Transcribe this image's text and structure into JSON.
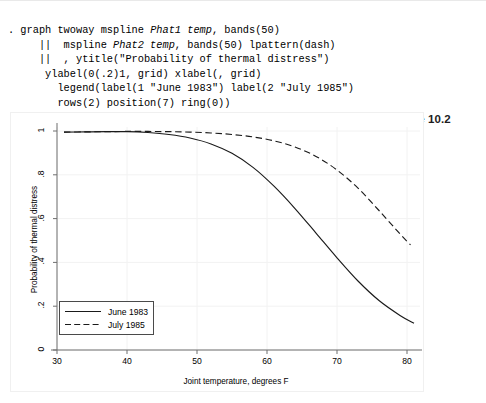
{
  "console": {
    "lines": [
      ". graph twoway mspline <i>Phat1 temp</i>, bands(50)",
      "     || &nbsp;mspline <i>Phat2 temp</i>, bands(50) lpattern(dash)",
      "     || &nbsp;, ytitle(\"Probability of thermal distress\")",
      "      ylabel(0(.2)1, grid) xlabel(, grid)",
      "        legend(label(1 \"June 1983\") label(2 \"July 1985\")",
      "        rows(2) position(7) ring(0))"
    ]
  },
  "figure": {
    "label": "Figure 10.2"
  },
  "chart_data": {
    "type": "line",
    "title": "",
    "xlabel": "Joint temperature, degrees F",
    "ylabel": "Probability of thermal distress",
    "xlim": [
      30,
      81
    ],
    "ylim": [
      0,
      1
    ],
    "xticks": [
      30,
      40,
      50,
      60,
      70,
      80
    ],
    "xtick_labels": [
      "30",
      "40",
      "50",
      "60",
      "70",
      "80"
    ],
    "yticks": [
      0,
      0.2,
      0.4,
      0.6,
      0.8,
      1
    ],
    "ytick_labels": [
      "0",
      ".2",
      ".4",
      ".6",
      ".8",
      "1"
    ],
    "grid": true,
    "legend_position": "inner lower left",
    "series": [
      {
        "name": "June 1983",
        "style": "solid",
        "color": "#1a1a1a",
        "x": [
          31,
          34,
          37,
          40,
          43,
          46,
          49,
          52,
          55,
          58,
          61,
          64,
          67,
          70,
          73,
          76,
          79,
          81
        ],
        "y": [
          0.995,
          0.996,
          0.997,
          0.997,
          0.993,
          0.984,
          0.968,
          0.941,
          0.898,
          0.834,
          0.748,
          0.646,
          0.534,
          0.421,
          0.315,
          0.226,
          0.158,
          0.122
        ]
      },
      {
        "name": "July 1985",
        "style": "dash",
        "color": "#1a1a1a",
        "x": [
          31,
          34,
          37,
          40,
          43,
          46,
          49,
          52,
          55,
          58,
          61,
          64,
          67,
          70,
          73,
          76,
          79,
          80.5
        ],
        "y": [
          0.995,
          0.996,
          0.997,
          0.998,
          0.998,
          0.997,
          0.995,
          0.991,
          0.984,
          0.973,
          0.955,
          0.927,
          0.884,
          0.822,
          0.739,
          0.637,
          0.53,
          0.48
        ]
      }
    ]
  }
}
